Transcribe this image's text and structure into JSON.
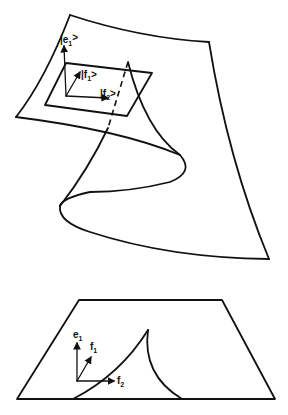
{
  "figure": {
    "upper": {
      "name": "curved surface with tangent plane",
      "labels": {
        "e1": {
          "base": "|e",
          "sub": "1",
          "end": ">"
        },
        "f1": {
          "base": "|f",
          "sub": "1",
          "end": ">"
        },
        "f2": {
          "base": "|f",
          "sub": "2",
          "end": ">"
        }
      }
    },
    "lower": {
      "name": "flat projected plane with cusp curve",
      "labels": {
        "e1": {
          "base": "e",
          "sub": "1"
        },
        "f1": {
          "base": "f",
          "sub": "1"
        },
        "f2": {
          "base": "f",
          "sub": "2"
        }
      }
    },
    "colors": {
      "ink": "#111111",
      "background": "#ffffff"
    }
  }
}
